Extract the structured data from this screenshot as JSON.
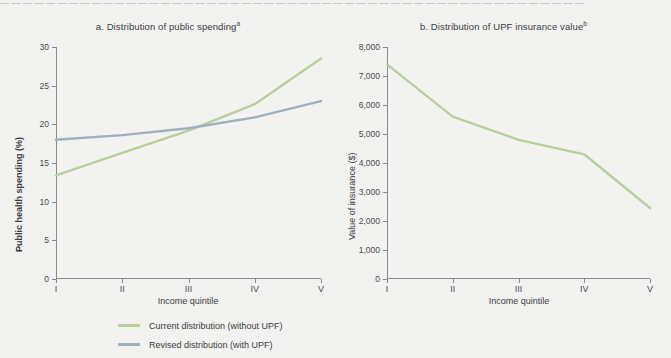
{
  "topline": "— — — — — — — — — — — — — — — — — — — — — — — — — — — — — — — — — — — — — — — — — — — — — — — — — — —",
  "colors": {
    "current": "#b9cf9a",
    "revised": "#9fb0bd",
    "insurance": "#b9cf9a",
    "axis": "#8a8a8a",
    "background": "#f2f2f1",
    "text": "#3c3c3c"
  },
  "legend": {
    "items": [
      {
        "label": "Current distribution (without UPF)",
        "color": "#b9cf9a"
      },
      {
        "label": "Revised distribution (with UPF)",
        "color": "#9fb0bd"
      }
    ]
  },
  "chart_data": [
    {
      "type": "line",
      "panel": "a",
      "title": "a. Distribution of public spending",
      "title_sup": "a",
      "xlabel": "Income quintile",
      "ylabel": "Public health spending (%)",
      "categories": [
        "I",
        "II",
        "III",
        "IV",
        "V"
      ],
      "ylim": [
        0,
        30
      ],
      "yticks": [
        0,
        5,
        10,
        15,
        20,
        25,
        30
      ],
      "yticklabels": [
        "0",
        "5",
        "10",
        "15",
        "20",
        "25",
        "30"
      ],
      "grid": false,
      "legend_position": "below",
      "series": [
        {
          "name": "Current distribution (without UPF)",
          "color": "#b9cf9a",
          "values": [
            13.4,
            16.3,
            19.2,
            22.6,
            28.5
          ]
        },
        {
          "name": "Revised distribution (with UPF)",
          "color": "#9fb0bd",
          "values": [
            18.0,
            18.6,
            19.5,
            20.9,
            23.0
          ]
        }
      ]
    },
    {
      "type": "line",
      "panel": "b",
      "title": "b. Distribution of UPF insurance value",
      "title_sup": "b",
      "xlabel": "Income quintile",
      "ylabel": "Value of insurance ($)",
      "categories": [
        "I",
        "II",
        "III",
        "IV",
        "V"
      ],
      "ylim": [
        0,
        8000
      ],
      "yticks": [
        0,
        1000,
        2000,
        3000,
        4000,
        5000,
        6000,
        7000,
        8000
      ],
      "yticklabels": [
        "0",
        "1,000",
        "2,000",
        "3,000",
        "4,000",
        "5,000",
        "6,000",
        "7,000",
        "8,000"
      ],
      "grid": false,
      "legend_position": "none",
      "series": [
        {
          "name": "UPF insurance value",
          "color": "#b9cf9a",
          "values": [
            7400,
            5600,
            4800,
            4300,
            2450
          ]
        }
      ]
    }
  ]
}
